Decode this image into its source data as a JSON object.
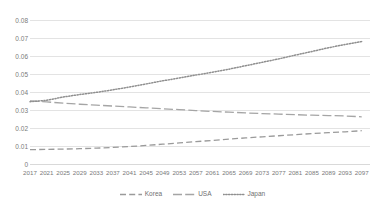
{
  "chart_data": {
    "type": "line",
    "title": "",
    "xlabel": "",
    "ylabel": "",
    "ylim": [
      0,
      0.08
    ],
    "ytick_step": 0.01,
    "yticks": [
      "0.08",
      "0.07",
      "0.06",
      "0.05",
      "0.04",
      "0.03",
      "0.02",
      "0.01",
      "0"
    ],
    "ytick_values": [
      0.08,
      0.07,
      0.06,
      0.05,
      0.04,
      0.03,
      0.02,
      0.01,
      0
    ],
    "grid": "horizontal",
    "legend_position": "bottom-center",
    "x": [
      2017,
      2021,
      2025,
      2029,
      2033,
      2037,
      2041,
      2045,
      2049,
      2053,
      2057,
      2061,
      2065,
      2069,
      2073,
      2077,
      2081,
      2085,
      2089,
      2093,
      2097
    ],
    "xtick_labels": [
      "2017",
      "2021",
      "2025",
      "2029",
      "2033",
      "2037",
      "2041",
      "2045",
      "2049",
      "2053",
      "2057",
      "2061",
      "2065",
      "2069",
      "2073",
      "2077",
      "2081",
      "2085",
      "2089",
      "2093",
      "2097"
    ],
    "xlim": [
      2017,
      2099
    ],
    "series": [
      {
        "name": "Korea",
        "style": "dashed",
        "color": "#9a9a9a",
        "values": [
          0.008,
          0.0081,
          0.0083,
          0.0085,
          0.0088,
          0.0092,
          0.0097,
          0.0103,
          0.011,
          0.0117,
          0.0124,
          0.0131,
          0.0138,
          0.0145,
          0.0151,
          0.0157,
          0.0163,
          0.0169,
          0.0174,
          0.0179,
          0.0185
        ]
      },
      {
        "name": "USA",
        "style": "long-dash",
        "color": "#a5a5a5",
        "values": [
          0.0351,
          0.0345,
          0.0338,
          0.0332,
          0.0327,
          0.0322,
          0.0317,
          0.0312,
          0.0307,
          0.0302,
          0.0297,
          0.0292,
          0.0288,
          0.0284,
          0.028,
          0.0277,
          0.0274,
          0.0271,
          0.0269,
          0.0267,
          0.0262
        ]
      },
      {
        "name": "Japan",
        "style": "dotted",
        "color": "#8f8f8f",
        "values": [
          0.0346,
          0.0354,
          0.0372,
          0.0386,
          0.0398,
          0.0412,
          0.0428,
          0.0445,
          0.0462,
          0.0478,
          0.0494,
          0.051,
          0.0527,
          0.0546,
          0.0565,
          0.0584,
          0.0605,
          0.0625,
          0.0646,
          0.0664,
          0.068
        ]
      }
    ]
  },
  "legend": {
    "items": [
      {
        "label": "Korea",
        "swatch": "dashed-line-swatch"
      },
      {
        "label": "USA",
        "swatch": "long-dash-line-swatch"
      },
      {
        "label": "Japan",
        "swatch": "dotted-line-swatch"
      }
    ]
  }
}
